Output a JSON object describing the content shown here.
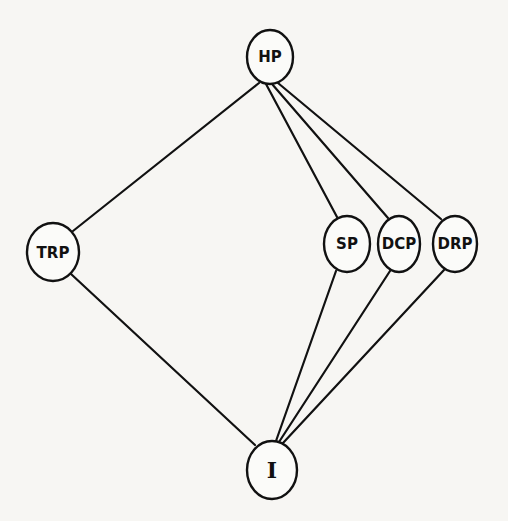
{
  "diagram": {
    "type": "hasse-lattice",
    "nodes": [
      {
        "id": "HP",
        "label": "HP",
        "x": 270,
        "y": 57,
        "rx": 23,
        "ry": 27
      },
      {
        "id": "TRP",
        "label": "TRP",
        "x": 53,
        "y": 252,
        "rx": 26,
        "ry": 29
      },
      {
        "id": "SP",
        "label": "SP",
        "x": 347,
        "y": 244,
        "rx": 23,
        "ry": 28
      },
      {
        "id": "DCP",
        "label": "DCP",
        "x": 399,
        "y": 244,
        "rx": 21,
        "ry": 28
      },
      {
        "id": "DRP",
        "label": "DRP",
        "x": 455,
        "y": 244,
        "rx": 22,
        "ry": 28
      },
      {
        "id": "I",
        "label": "I",
        "x": 272,
        "y": 470,
        "rx": 25,
        "ry": 29
      }
    ],
    "edges": [
      {
        "from": "HP",
        "to": "TRP"
      },
      {
        "from": "HP",
        "to": "SP"
      },
      {
        "from": "HP",
        "to": "DCP"
      },
      {
        "from": "HP",
        "to": "DRP"
      },
      {
        "from": "TRP",
        "to": "I"
      },
      {
        "from": "SP",
        "to": "I"
      },
      {
        "from": "DCP",
        "to": "I"
      },
      {
        "from": "DRP",
        "to": "I"
      }
    ]
  },
  "labels": {
    "hp": "HP",
    "trp": "TRP",
    "sp": "SP",
    "dcp": "DCP",
    "drp": "DRP",
    "i": "I"
  }
}
